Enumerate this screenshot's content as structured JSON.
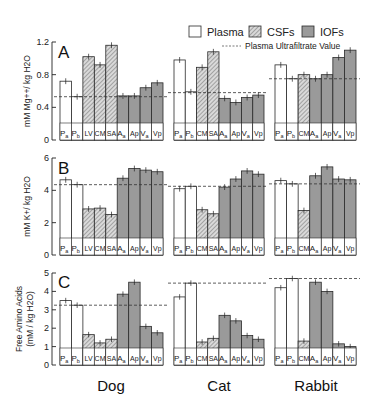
{
  "legend": {
    "plasma": "Plasma",
    "csfs": "CSFs",
    "iofs": "IOFs",
    "ultrafiltrate": "Plasma Ultrafiltrate Value"
  },
  "colors": {
    "plasma_fill": "#ffffff",
    "csf_fill": "#d9d9d9",
    "csf_hatch": "#6a6a6a",
    "iof_fill": "#9a9a9a",
    "stroke": "#2a2a2a"
  },
  "species_labels": [
    "Dog",
    "Cat",
    "Rabbit"
  ],
  "chart_data": [
    {
      "type": "bar",
      "panel": "A",
      "ylabel": "mM Mg++/ kg H2O",
      "ylim": [
        0,
        1.2
      ],
      "yticks": [
        0,
        0.4,
        0.8,
        1.2
      ],
      "ytick_labels": [
        "0",
        "0.4",
        "0.8",
        "1.2"
      ],
      "groups": [
        {
          "species": "Dog",
          "categories": [
            "Pa",
            "Pb",
            "LV",
            "CM",
            "SA",
            "Aa",
            "Ap",
            "Va",
            "Vp"
          ],
          "kinds": [
            "plasma",
            "plasma",
            "csf",
            "csf",
            "csf",
            "iof",
            "iof",
            "iof",
            "iof"
          ],
          "values": [
            0.72,
            0.53,
            1.02,
            0.92,
            1.16,
            0.54,
            0.54,
            0.64,
            0.7
          ],
          "ultrafiltrate": 0.53
        },
        {
          "species": "Cat",
          "categories": [
            "Pa",
            "Pb",
            "CM",
            "SA",
            "Aa",
            "Ap",
            "Va",
            "Vp"
          ],
          "kinds": [
            "plasma",
            "plasma",
            "csf",
            "csf",
            "iof",
            "iof",
            "iof",
            "iof"
          ],
          "values": [
            0.98,
            0.59,
            0.89,
            1.08,
            0.51,
            0.46,
            0.52,
            0.55
          ],
          "ultrafiltrate": 0.58
        },
        {
          "species": "Rabbit",
          "categories": [
            "Pa",
            "Pb",
            "CM",
            "Aa",
            "Ap",
            "Va",
            "Vp"
          ],
          "kinds": [
            "plasma",
            "plasma",
            "csf",
            "iof",
            "iof",
            "iof",
            "iof"
          ],
          "values": [
            0.92,
            0.75,
            0.8,
            0.75,
            0.8,
            1.01,
            1.1
          ],
          "ultrafiltrate": 0.75
        }
      ]
    },
    {
      "type": "bar",
      "panel": "B",
      "ylabel": "mM K+/ kg H2O",
      "ylim": [
        0,
        6
      ],
      "yticks": [
        0,
        2,
        4,
        6
      ],
      "ytick_labels": [
        "0",
        "2",
        "4",
        "6"
      ],
      "groups": [
        {
          "species": "Dog",
          "categories": [
            "Pa",
            "Pb",
            "LV",
            "CM",
            "SA",
            "Aa",
            "Ap",
            "Va",
            "Vp"
          ],
          "kinds": [
            "plasma",
            "plasma",
            "csf",
            "csf",
            "csf",
            "iof",
            "iof",
            "iof",
            "iof"
          ],
          "values": [
            4.65,
            4.35,
            2.85,
            2.9,
            2.5,
            4.75,
            5.35,
            5.25,
            5.15
          ],
          "ultrafiltrate": 4.35
        },
        {
          "species": "Cat",
          "categories": [
            "Pa",
            "Pb",
            "CM",
            "SA",
            "Aa",
            "Ap",
            "Va",
            "Vp"
          ],
          "kinds": [
            "plasma",
            "plasma",
            "csf",
            "csf",
            "iof",
            "iof",
            "iof",
            "iof"
          ],
          "values": [
            4.1,
            4.25,
            2.8,
            2.55,
            4.2,
            4.7,
            5.2,
            5.0
          ],
          "ultrafiltrate": 4.25
        },
        {
          "species": "Rabbit",
          "categories": [
            "Pa",
            "Pb",
            "CM",
            "Aa",
            "Ap",
            "Va",
            "Vp"
          ],
          "kinds": [
            "plasma",
            "plasma",
            "csf",
            "iof",
            "iof",
            "iof",
            "iof"
          ],
          "values": [
            4.6,
            4.4,
            2.75,
            4.9,
            5.45,
            4.7,
            4.65
          ],
          "ultrafiltrate": 4.4
        }
      ]
    },
    {
      "type": "bar",
      "panel": "C",
      "ylabel": "Free Amino Acids (mM / kg H2O)",
      "ylim": [
        0,
        5
      ],
      "yticks": [
        0,
        1,
        2,
        3,
        4,
        5
      ],
      "ytick_labels": [
        "0",
        "1",
        "2",
        "3",
        "4",
        "5"
      ],
      "groups": [
        {
          "species": "Dog",
          "categories": [
            "Pa",
            "Pb",
            "LV",
            "CM",
            "SA",
            "Aa",
            "Ap",
            "Va",
            "Vp"
          ],
          "kinds": [
            "plasma",
            "plasma",
            "csf",
            "csf",
            "csf",
            "iof",
            "iof",
            "iof",
            "iof"
          ],
          "values": [
            3.5,
            3.25,
            1.65,
            1.2,
            1.4,
            3.85,
            4.5,
            2.1,
            1.75
          ],
          "ultrafiltrate": 3.25
        },
        {
          "species": "Cat",
          "categories": [
            "Pa",
            "Pb",
            "CM",
            "SA",
            "Aa",
            "Ap",
            "Va",
            "Vp"
          ],
          "kinds": [
            "plasma",
            "plasma",
            "csf",
            "csf",
            "iof",
            "iof",
            "iof",
            "iof"
          ],
          "values": [
            3.7,
            4.45,
            1.25,
            1.45,
            2.7,
            2.4,
            1.6,
            1.4
          ],
          "ultrafiltrate": 4.45
        },
        {
          "species": "Rabbit",
          "categories": [
            "Pa",
            "Pb",
            "CM",
            "Aa",
            "Ap",
            "Va",
            "Vp"
          ],
          "kinds": [
            "plasma",
            "plasma",
            "csf",
            "iof",
            "iof",
            "iof",
            "iof"
          ],
          "values": [
            4.2,
            4.7,
            1.3,
            4.5,
            4.0,
            1.15,
            1.0
          ],
          "ultrafiltrate": 4.7
        }
      ]
    }
  ]
}
